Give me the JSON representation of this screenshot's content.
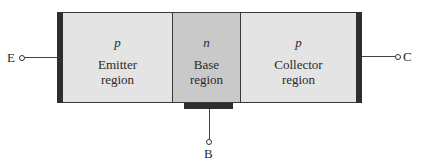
{
  "diagram": {
    "type": "pnp-transistor-structure",
    "regions": [
      {
        "id": "emitter",
        "doping": "p",
        "label_line1": "Emitter",
        "label_line2": "region",
        "fill": "#e4e4e4"
      },
      {
        "id": "base",
        "doping": "n",
        "label_line1": "Base",
        "label_line2": "region",
        "fill": "#c9c9c9"
      },
      {
        "id": "collector",
        "doping": "p",
        "label_line1": "Collector",
        "label_line2": "region",
        "fill": "#e4e4e4"
      }
    ],
    "terminals": {
      "emitter": "E",
      "base": "B",
      "collector": "C"
    },
    "contact_color": "#2e2e2e"
  }
}
